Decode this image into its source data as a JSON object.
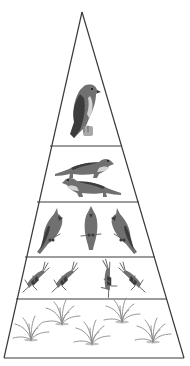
{
  "diagram": {
    "type": "food-pyramid",
    "colors": {
      "outline": "#3a3a3a",
      "ink": "#3c3c3c",
      "background": "#ffffff"
    },
    "levels": [
      {
        "rank": 1,
        "organism": "hawk",
        "count": 1,
        "role": "top predator"
      },
      {
        "rank": 2,
        "organism": "weasel",
        "count": 2,
        "role": "secondary consumer"
      },
      {
        "rank": 3,
        "organism": "cardinal",
        "count": 3,
        "role": "primary consumer predator"
      },
      {
        "rank": 4,
        "organism": "grasshopper",
        "count": 4,
        "role": "primary consumer"
      },
      {
        "rank": 5,
        "organism": "grass",
        "count": 5,
        "role": "producer"
      }
    ]
  }
}
